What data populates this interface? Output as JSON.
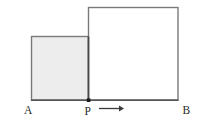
{
  "figure": {
    "name": "two-squares-on-line-AB",
    "background_color": "#ffffff",
    "canvas": {
      "width": 200,
      "height": 123
    },
    "colors": {
      "outline": "#6f6f6f",
      "outline_dark": "#4a4a4a",
      "fill_shaded": "#ededed",
      "fill_plain": "#ffffff",
      "label_text": "#2b2b2b",
      "baseline": "#555555",
      "point_marker": "#1a1a1a",
      "arrow": "#3a3a3a"
    },
    "baseline": {
      "label": "AB",
      "y": 100,
      "x_start": 31,
      "x_end": 178
    },
    "shapes": [
      {
        "id": "left-square",
        "type": "square",
        "filled": true,
        "x": 31,
        "y": 36,
        "size": 57.5,
        "fill": "#ededed",
        "stroke": "#6f6f6f"
      },
      {
        "id": "right-square",
        "type": "square",
        "filled": false,
        "x": 88.5,
        "y": 7,
        "size": 92.5,
        "fill": "#ffffff",
        "stroke": "#6f6f6f"
      }
    ],
    "points": [
      {
        "id": "A",
        "label": "A",
        "x": 31,
        "y": 100,
        "label_x": 24,
        "label_y": 113,
        "marker": false
      },
      {
        "id": "P",
        "label": "P",
        "x": 88.5,
        "y": 100,
        "label_x": 85,
        "label_y": 114,
        "marker": true
      },
      {
        "id": "B",
        "label": "B",
        "x": 178,
        "y": 100,
        "label_x": 183,
        "label_y": 113,
        "marker": false
      }
    ],
    "arrow": {
      "id": "motion-arrow",
      "direction": "right",
      "x_start": 99,
      "x_end": 123,
      "y": 108.5,
      "color": "#3a3a3a"
    }
  }
}
